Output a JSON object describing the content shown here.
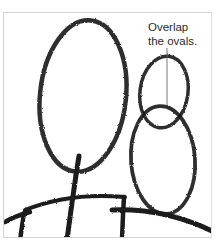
{
  "illustration": {
    "description": "Drawing tutorial step: two figures sketched as ovals with ground lines",
    "callout": {
      "line1": "Overlap",
      "line2": "the ovals."
    },
    "colors": {
      "stroke": "#1a1a1a",
      "frame": "#d4d4d4",
      "background": "#ffffff",
      "text": "#2a2a2a"
    },
    "shapes": {
      "large_oval": {
        "cx": 83,
        "cy": 96,
        "rx": 43,
        "ry": 76
      },
      "head_oval": {
        "cx": 164,
        "cy": 92,
        "rx": 24,
        "ry": 36
      },
      "body_oval": {
        "cx": 163,
        "cy": 160,
        "rx": 32,
        "ry": 54
      }
    }
  }
}
